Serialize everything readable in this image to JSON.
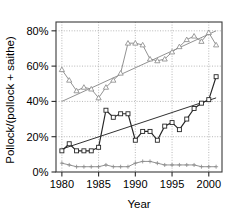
{
  "chart_data": {
    "type": "line",
    "title": "",
    "xlabel": "Year",
    "ylabel": "Pollock/(pollock + saithe)",
    "xlim": [
      1979.2,
      2001.8
    ],
    "ylim": [
      0,
      85
    ],
    "xticks": [
      1980,
      1985,
      1990,
      1995,
      2000
    ],
    "xtick_labels": [
      "1980",
      "1985",
      "1990",
      "1995",
      "2000"
    ],
    "yticks": [
      0,
      20,
      40,
      60,
      80
    ],
    "ytick_labels": [
      "0%",
      "20%",
      "40%",
      "60%",
      "80%"
    ],
    "grid": true,
    "grid_style": "dotted",
    "legend": "none",
    "x": [
      1980,
      1981,
      1982,
      1983,
      1984,
      1985,
      1986,
      1987,
      1988,
      1989,
      1990,
      1991,
      1992,
      1993,
      1994,
      1995,
      1996,
      1997,
      1998,
      1999,
      2000,
      2001
    ],
    "series": [
      {
        "name": "triangle-series",
        "marker": "triangle",
        "color": "#8c8c8c",
        "values": [
          58,
          52,
          46,
          48,
          47,
          42,
          48,
          52,
          56,
          73,
          73,
          72,
          64,
          63,
          64,
          68,
          71,
          75,
          77,
          74,
          79,
          72
        ]
      },
      {
        "name": "square-series",
        "marker": "square",
        "color": "#262626",
        "values": [
          12,
          16,
          12,
          12,
          12,
          14,
          35,
          31,
          33,
          33,
          18,
          23,
          23,
          18,
          26,
          28,
          24,
          30,
          36,
          39,
          41,
          54
        ]
      },
      {
        "name": "plus-series",
        "marker": "plus",
        "color": "#8c8c8c",
        "values": [
          5,
          4,
          3,
          3,
          3,
          3,
          4,
          3,
          3,
          3,
          5,
          6,
          6,
          5,
          4,
          4,
          4,
          4,
          4,
          3,
          3,
          3
        ]
      }
    ],
    "trend_lines": [
      {
        "name": "triangle-trend",
        "color": "#8c8c8c",
        "x": [
          1980,
          2001
        ],
        "y": [
          40,
          80
        ]
      },
      {
        "name": "square-trend",
        "color": "#262626",
        "x": [
          1980,
          2001
        ],
        "y": [
          13,
          42
        ]
      }
    ]
  },
  "axes": {
    "x_title": "Year",
    "y_title": "Pollock/(pollock + saithe)"
  }
}
